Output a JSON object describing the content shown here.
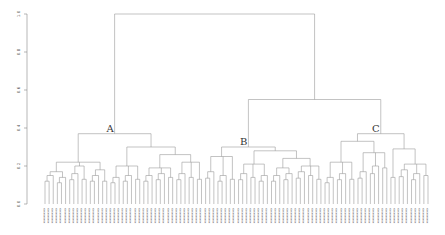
{
  "chart_data": {
    "type": "dendrogram",
    "title": "",
    "xlabel": "",
    "ylabel": "",
    "ylim": [
      0,
      1.0
    ],
    "y_ticks": [
      "0.0",
      "0.2",
      "0.4",
      "0.6",
      "0.8",
      "1.0"
    ],
    "grid": false,
    "cluster_labels": [
      {
        "name": "A",
        "height": 0.38
      },
      {
        "name": "B",
        "height": 0.32
      },
      {
        "name": "C",
        "height": 0.38
      }
    ],
    "merges": [
      {
        "between": [
          "A",
          "B+C"
        ],
        "height": 1.0
      },
      {
        "between": [
          "B",
          "C"
        ],
        "height": 0.55
      }
    ],
    "leaf_count": 115,
    "tree": {
      "h": 1.0,
      "c": [
        {
          "h": 0.37,
          "label": "A",
          "c": [
            {
              "h": 0.22,
              "c": [
                {
                  "h": 0.17,
                  "c": [
                    {
                      "n": 3,
                      "h": 0.15
                    },
                    {
                      "n": 3,
                      "h": 0.14
                    }
                  ]
                },
                {
                  "h": 0.2,
                  "c": [
                    {
                      "n": 3,
                      "h": 0.16
                    },
                    {
                      "n": 2,
                      "h": 0.13
                    }
                  ]
                },
                {
                  "h": 0.18,
                  "c": [
                    {
                      "n": 3,
                      "h": 0.15
                    },
                    {
                      "n": 2,
                      "h": 0.12
                    }
                  ]
                }
              ]
            },
            {
              "h": 0.3,
              "c": [
                {
                  "h": 0.2,
                  "c": [
                    {
                      "n": 3,
                      "h": 0.14
                    },
                    {
                      "n": 3,
                      "h": 0.15
                    },
                    {
                      "n": 2,
                      "h": 0.13
                    }
                  ]
                },
                {
                  "h": 0.26,
                  "c": [
                    {
                      "h": 0.19,
                      "c": [
                        {
                          "n": 3,
                          "h": 0.15
                        },
                        {
                          "n": 3,
                          "h": 0.16
                        },
                        {
                          "n": 2,
                          "h": 0.14
                        }
                      ]
                    },
                    {
                      "h": 0.22,
                      "c": [
                        {
                          "n": 3,
                          "h": 0.16
                        },
                        {
                          "n": 2,
                          "h": 0.14
                        },
                        {
                          "n": 2,
                          "h": 0.13
                        }
                      ]
                    }
                  ]
                }
              ]
            }
          ]
        },
        {
          "h": 0.55,
          "c": [
            {
              "h": 0.3,
              "label": "B",
              "c": [
                {
                  "h": 0.25,
                  "c": [
                    {
                      "n": 3,
                      "h": 0.17
                    },
                    {
                      "n": 3,
                      "h": 0.15
                    },
                    {
                      "n": 2,
                      "h": 0.13
                    }
                  ]
                },
                {
                  "h": 0.28,
                  "c": [
                    {
                      "h": 0.21,
                      "c": [
                        {
                          "n": 3,
                          "h": 0.16
                        },
                        {
                          "n": 2,
                          "h": 0.14
                        },
                        {
                          "n": 3,
                          "h": 0.15
                        }
                      ]
                    },
                    {
                      "h": 0.24,
                      "c": [
                        {
                          "h": 0.19,
                          "c": [
                            {
                              "n": 3,
                              "h": 0.15
                            },
                            {
                              "n": 3,
                              "h": 0.16
                            }
                          ]
                        },
                        {
                          "h": 0.2,
                          "c": [
                            {
                              "n": 3,
                              "h": 0.17
                            },
                            {
                              "n": 2,
                              "h": 0.15
                            },
                            {
                              "n": 2,
                              "h": 0.13
                            }
                          ]
                        }
                      ]
                    }
                  ]
                }
              ]
            },
            {
              "h": 0.37,
              "label": "C",
              "c": [
                {
                  "h": 0.33,
                  "c": [
                    {
                      "h": 0.22,
                      "c": [
                        {
                          "n": 3,
                          "h": 0.14
                        },
                        {
                          "n": 3,
                          "h": 0.16
                        },
                        {
                          "n": 2,
                          "h": 0.13
                        }
                      ]
                    },
                    {
                      "h": 0.27,
                      "c": [
                        {
                          "n": 3,
                          "h": 0.17
                        },
                        {
                          "n": 3,
                          "h": 0.2
                        },
                        {
                          "n": 2,
                          "h": 0.19
                        }
                      ]
                    }
                  ]
                },
                {
                  "h": 0.29,
                  "c": [
                    {
                      "n": 2,
                      "h": 0.14
                    },
                    {
                      "h": 0.21,
                      "c": [
                        {
                          "n": 3,
                          "h": 0.18
                        },
                        {
                          "n": 3,
                          "h": 0.16
                        },
                        {
                          "n": 2,
                          "h": 0.15
                        }
                      ]
                    }
                  ]
                }
              ]
            }
          ]
        }
      ]
    }
  },
  "colors": {
    "line": "#9a9a9a",
    "axis": "#888888",
    "text": "#333333"
  }
}
